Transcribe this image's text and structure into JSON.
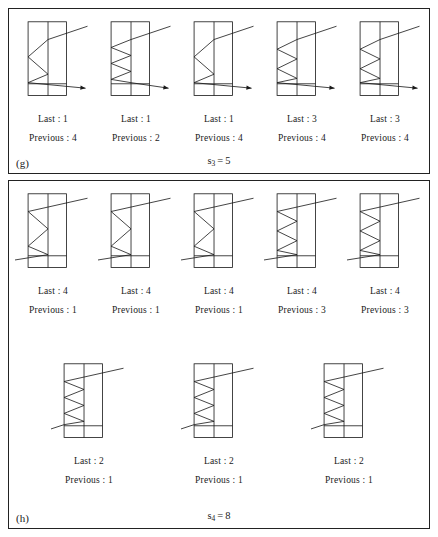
{
  "panels": [
    {
      "tag": "(g)",
      "summary": {
        "symbol": "s",
        "subscript": "3",
        "equals": "=",
        "value": "5"
      },
      "rows": [
        {
          "figures": [
            {
              "last_label": "Last : 1",
              "previous_label": "Previous : 4",
              "last": "1",
              "previous": "4",
              "direction": "right"
            },
            {
              "last_label": "Last : 1",
              "previous_label": "Previous : 2",
              "last": "1",
              "previous": "2",
              "direction": "right"
            },
            {
              "last_label": "Last : 1",
              "previous_label": "Previous : 4",
              "last": "1",
              "previous": "4",
              "direction": "right"
            },
            {
              "last_label": "Last : 3",
              "previous_label": "Previous : 4",
              "last": "3",
              "previous": "4",
              "direction": "right"
            },
            {
              "last_label": "Last : 3",
              "previous_label": "Previous : 4",
              "last": "3",
              "previous": "4",
              "direction": "right"
            }
          ]
        }
      ]
    },
    {
      "tag": "(h)",
      "summary": {
        "symbol": "s",
        "subscript": "4",
        "equals": "=",
        "value": "8"
      },
      "rows": [
        {
          "figures": [
            {
              "last_label": "Last : 4",
              "previous_label": "Previous : 1",
              "last": "4",
              "previous": "1",
              "direction": "left"
            },
            {
              "last_label": "Last : 4",
              "previous_label": "Previous : 1",
              "last": "4",
              "previous": "1",
              "direction": "left"
            },
            {
              "last_label": "Last : 4",
              "previous_label": "Previous : 1",
              "last": "4",
              "previous": "1",
              "direction": "left"
            },
            {
              "last_label": "Last : 4",
              "previous_label": "Previous : 3",
              "last": "4",
              "previous": "3",
              "direction": "left"
            },
            {
              "last_label": "Last : 4",
              "previous_label": "Previous : 3",
              "last": "4",
              "previous": "3",
              "direction": "left"
            }
          ]
        },
        {
          "figures": [
            {
              "last_label": "Last : 2",
              "previous_label": "Previous : 1",
              "last": "2",
              "previous": "1",
              "direction": "left"
            },
            {
              "last_label": "Last : 2",
              "previous_label": "Previous : 1",
              "last": "2",
              "previous": "1",
              "direction": "left"
            },
            {
              "last_label": "Last : 2",
              "previous_label": "Previous : 1",
              "last": "2",
              "previous": "1",
              "direction": "left"
            }
          ]
        }
      ]
    }
  ],
  "style": {
    "stroke_color": "#1a1a1a",
    "background": "#ffffff"
  }
}
